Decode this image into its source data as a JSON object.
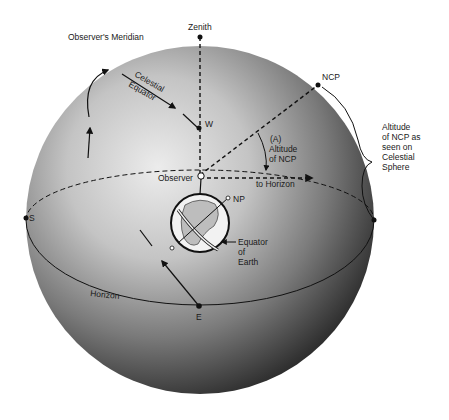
{
  "diagram": {
    "labels": {
      "zenith": "Zenith",
      "observers_meridian": "Observer's Meridian",
      "celestial_equator_1": "Celestial",
      "celestial_equator_2": "Equator",
      "west": "W",
      "ncp": "NCP",
      "angle_a": "(A)",
      "altitude_of_ncp_1": "Altitude",
      "altitude_of_ncp_2": "of NCP",
      "observer": "Observer",
      "to_horizon": "to Horizon",
      "np": "NP",
      "equator_of_earth_1": "Equator",
      "equator_of_earth_2": "of",
      "equator_of_earth_3": "Earth",
      "south": "S",
      "horizon": "Horizon",
      "east": "E",
      "side_note_1": "Altitude",
      "side_note_2": "of NCP as",
      "side_note_3": "seen on",
      "side_note_4": "Celestial",
      "side_note_5": "Sphere"
    },
    "colors": {
      "background": "#ffffff",
      "sphere_light": "#e6e6e6",
      "sphere_dark": "#1c1c1c",
      "line": "#111111"
    }
  }
}
